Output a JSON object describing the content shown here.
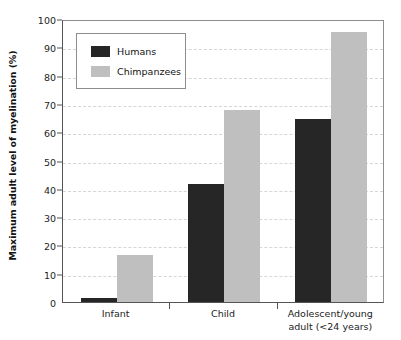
{
  "chart_data": {
    "type": "bar",
    "title": "",
    "xlabel": "",
    "ylabel": "Maximum adult level of myelination (%)",
    "categories": [
      "Infant",
      "Child",
      "Adolescent/young\nadult (<24 years)"
    ],
    "series": [
      {
        "name": "Humans",
        "color": "#262626",
        "values": [
          1.5,
          41.8,
          64.5
        ]
      },
      {
        "name": "Chimpanzees",
        "color": "#bfbfbf",
        "values": [
          16.5,
          67.8,
          95.5
        ]
      }
    ],
    "ylim": [
      0,
      100
    ],
    "yticks": [
      0,
      10,
      20,
      30,
      40,
      50,
      60,
      70,
      80,
      90,
      100
    ],
    "ytick_labels": [
      "0",
      "10",
      "20",
      "30",
      "40",
      "50",
      "60",
      "70",
      "80",
      "90",
      "100"
    ],
    "grid": "horizontal-dashed",
    "legend_position": "upper-left-inside"
  },
  "legend": {
    "entries": [
      {
        "label": "Humans",
        "color": "#262626"
      },
      {
        "label": "Chimpanzees",
        "color": "#bfbfbf"
      }
    ]
  },
  "axes": {
    "y_title": "Maximum adult level of myelination (%)"
  }
}
